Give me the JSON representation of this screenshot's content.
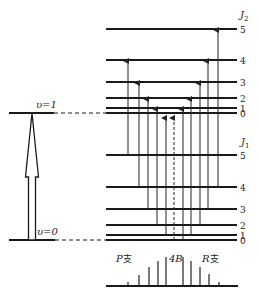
{
  "diagram": {
    "vibrational_levels": [
      {
        "label": "υ=1",
        "y": 113,
        "x1": 9,
        "x2": 54
      },
      {
        "label": "υ=0",
        "y": 240,
        "x1": 9,
        "x2": 55
      }
    ],
    "vibrational_arrow": {
      "x": 32,
      "y_bottom": 240,
      "y_tip": 113,
      "shaft_half_width": 3.5,
      "head_half_width": 6.5,
      "head_base_y": 177
    },
    "connector_x": 106,
    "rot_x1": 106,
    "rot_x2": 237,
    "upper_manifold": {
      "label": "J",
      "subscript": "2",
      "label_pos": {
        "x": 240,
        "y": 18
      },
      "levels": [
        {
          "J": "0",
          "y": 113
        },
        {
          "J": "1",
          "y": 108
        },
        {
          "J": "2",
          "y": 98
        },
        {
          "J": "3",
          "y": 82
        },
        {
          "J": "4",
          "y": 60
        },
        {
          "J": "5",
          "y": 29
        }
      ]
    },
    "lower_manifold": {
      "label": "J",
      "subscript": "1",
      "label_pos": {
        "x": 241,
        "y": 145
      },
      "levels": [
        {
          "J": "0",
          "y": 240
        },
        {
          "J": "1",
          "y": 235
        },
        {
          "J": "2",
          "y": 225
        },
        {
          "J": "3",
          "y": 209
        },
        {
          "J": "4",
          "y": 187
        },
        {
          "J": "5",
          "y": 155
        }
      ]
    },
    "transitions": [
      {
        "branch": "P",
        "from_J": 5,
        "to_J": 4,
        "x": 128,
        "dashed": false
      },
      {
        "branch": "P",
        "from_J": 4,
        "to_J": 3,
        "x": 139,
        "dashed": false
      },
      {
        "branch": "P",
        "from_J": 3,
        "to_J": 2,
        "x": 148,
        "dashed": false
      },
      {
        "branch": "P",
        "from_J": 2,
        "to_J": 1,
        "x": 157,
        "dashed": false
      },
      {
        "branch": "P",
        "from_J": 1,
        "to_J": 0,
        "x": 166,
        "dashed": false
      },
      {
        "branch": "Q",
        "from_J": 0,
        "to_J": 0,
        "x": 174,
        "dashed": true
      },
      {
        "branch": "R",
        "from_J": 0,
        "to_J": 1,
        "x": 183,
        "dashed": false
      },
      {
        "branch": "R",
        "from_J": 1,
        "to_J": 2,
        "x": 191,
        "dashed": false
      },
      {
        "branch": "R",
        "from_J": 2,
        "to_J": 3,
        "x": 200,
        "dashed": false
      },
      {
        "branch": "R",
        "from_J": 3,
        "to_J": 4,
        "x": 208,
        "dashed": false
      },
      {
        "branch": "R",
        "from_J": 4,
        "to_J": 5,
        "x": 218,
        "dashed": false
      }
    ],
    "spectrum": {
      "baseline_y": 286,
      "x1": 106,
      "x2": 238,
      "lines": [
        {
          "x": 128,
          "top": 282
        },
        {
          "x": 139,
          "top": 275
        },
        {
          "x": 149,
          "top": 267
        },
        {
          "x": 158,
          "top": 261
        },
        {
          "x": 166,
          "top": 257
        },
        {
          "x": 183,
          "top": 257
        },
        {
          "x": 191,
          "top": 261
        },
        {
          "x": 200,
          "top": 267
        },
        {
          "x": 209,
          "top": 274
        },
        {
          "x": 219,
          "top": 282
        }
      ],
      "labels": {
        "p_branch": {
          "letter": "P",
          "suffix": "支",
          "x": 116,
          "y": 262
        },
        "gap": {
          "text": "4B",
          "x": 169,
          "y": 262
        },
        "r_branch": {
          "letter": "R",
          "suffix": "支",
          "x": 202,
          "y": 262
        }
      }
    }
  }
}
